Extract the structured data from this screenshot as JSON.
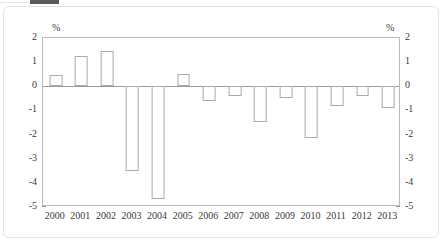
{
  "figure": {
    "unit_label_left": "%",
    "unit_label_right": "%",
    "axis_line_color": "#9a9a9a",
    "bar_edge_color": "#a9a9a9",
    "bar_fill_color": "#ffffff",
    "frame_color": "#e3e3e3"
  },
  "chart_data": {
    "type": "bar",
    "title": "",
    "subtitle": "",
    "xlabel": "",
    "ylabel": "%",
    "y2label": "%",
    "ylim": [
      -5,
      2
    ],
    "yticks": [
      2,
      1,
      0,
      -1,
      -2,
      -3,
      -4,
      -5
    ],
    "ytick_labels": [
      "2",
      "1",
      "0",
      "-1",
      "-2",
      "-3",
      "-4",
      "-5"
    ],
    "y2ticks": [
      2,
      1,
      0,
      -1,
      -2,
      -3,
      -4,
      -5
    ],
    "y2tick_labels": [
      "2",
      "1",
      "0",
      "-1",
      "-2",
      "-3",
      "-4",
      "-5"
    ],
    "grid": false,
    "legend": "none",
    "categories": [
      "2000",
      "2001",
      "2002",
      "2003",
      "2004",
      "2005",
      "2006",
      "2007",
      "2008",
      "2009",
      "2010",
      "2011",
      "2012",
      "2013"
    ],
    "values": [
      0.45,
      1.25,
      1.45,
      -3.5,
      -4.65,
      0.5,
      -0.6,
      -0.4,
      -1.5,
      -0.5,
      -2.15,
      -0.8,
      -0.4,
      -0.9
    ]
  }
}
